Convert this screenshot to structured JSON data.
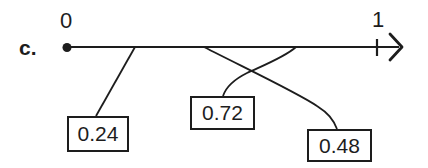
{
  "diagram": {
    "item_label": "c.",
    "number_line": {
      "min_label": "0",
      "max_label": "1"
    },
    "boxes": [
      {
        "label": "0.24"
      },
      {
        "label": "0.72"
      },
      {
        "label": "0.48"
      }
    ],
    "icons": {
      "origin_point": "filled-dot",
      "line_end": "right-arrowhead"
    },
    "colors": {
      "ink": "#1d1d1d",
      "background": "#ffffff"
    }
  }
}
